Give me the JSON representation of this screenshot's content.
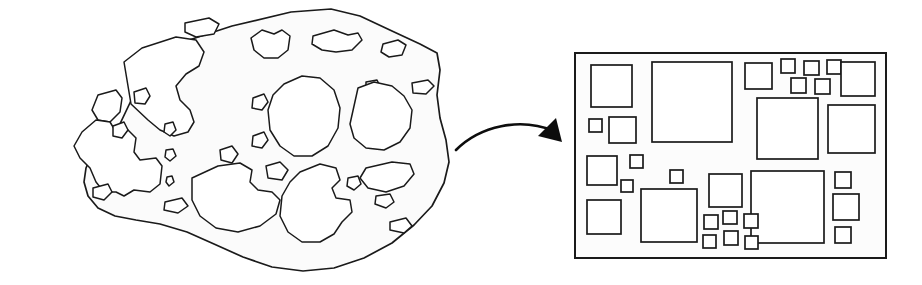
{
  "figure": {
    "background_color": "#ffffff",
    "ink_color": "#1a1a1a",
    "width": 922,
    "height": 285
  },
  "left_panel": {
    "label": "irregular-porous-shape",
    "description": "Hand-drawn irregular blob outline containing many rounded void regions of varying size",
    "matrix_fill_color": "#fbfbfb",
    "void_fill_color": "#ffffff",
    "void_count": 28,
    "outline_path": "M 118 128 L 148 65 L 183 42 L 232 26 L 291 12 L 331 9 L 360 16 L 392 31 L 420 44 L 437 53 L 440 70 L 437 95 L 440 118 L 446 140 L 449 162 L 444 183 L 432 206 L 414 225 L 392 243 L 364 258 L 334 268 L 303 271 L 272 267 L 243 257 L 214 244 L 187 232 L 160 224 L 136 220 L 115 216 L 98 208 L 88 196 L 84 182 L 86 168 L 93 152 Z",
    "voids": [
      {
        "name": "void-upper-left-large",
        "path": "M 131 104 L 124 62 L 142 48 L 176 37 L 196 40 L 204 52 L 199 66 L 186 74 L 176 86 L 180 100 L 190 110 L 194 122 L 188 132 L 174 136 L 160 130 L 148 120 Z"
      },
      {
        "name": "void-top-notch",
        "path": "M 185 23 L 209 18 L 219 24 L 214 34 L 196 37 L 185 32 Z"
      },
      {
        "name": "void-top-mid-lobe",
        "path": "M 251 38 L 262 30 L 274 34 L 282 30 L 290 36 L 288 50 L 278 58 L 264 58 L 254 50 Z"
      },
      {
        "name": "void-top-right-wave",
        "path": "M 313 36 L 334 30 L 348 35 L 358 33 L 362 40 L 352 50 L 336 52 L 322 50 L 312 44 Z"
      },
      {
        "name": "void-top-far-right",
        "path": "M 383 44 L 398 40 L 406 45 L 402 55 L 389 57 L 381 52 Z"
      },
      {
        "name": "void-left-edge-notch",
        "path": "M 98 95 L 116 90 L 122 98 L 120 112 L 110 122 L 98 120 L 92 110 Z"
      },
      {
        "name": "void-small-left-upper",
        "path": "M 134 92 L 146 88 L 150 96 L 145 104 L 135 103 Z"
      },
      {
        "name": "void-mid-upper-dot",
        "path": "M 253 98 L 264 94 L 268 102 L 262 110 L 252 108 Z"
      },
      {
        "name": "void-right-upper-dot",
        "path": "M 366 82 L 377 80 L 381 88 L 374 94 L 366 90 Z"
      },
      {
        "name": "void-right-sliver",
        "path": "M 412 83 L 428 80 L 434 86 L 426 94 L 413 93 Z"
      },
      {
        "name": "void-center-large-round",
        "path": "M 284 84 L 302 76 L 320 78 L 334 90 L 340 108 L 338 128 L 328 146 L 312 156 L 294 156 L 280 146 L 270 130 L 268 110 L 273 95 Z"
      },
      {
        "name": "void-right-large-lobe",
        "path": "M 358 88 L 374 82 L 392 86 L 404 96 L 412 110 L 410 128 L 400 142 L 384 150 L 366 148 L 354 138 L 350 124 L 354 106 Z"
      },
      {
        "name": "void-left-star",
        "path": "M 82 132 L 96 120 L 110 122 L 116 132 L 128 130 L 136 138 L 134 152 L 140 160 L 156 158 L 162 166 L 160 184 L 150 192 L 134 190 L 124 196 L 116 192 L 104 192 L 96 182 L 90 168 L 80 158 L 74 146 Z"
      },
      {
        "name": "void-small-mid-1",
        "path": "M 113 126 L 124 122 L 128 130 L 122 138 L 113 136 Z"
      },
      {
        "name": "void-tiny-1",
        "path": "M 165 124 L 173 122 L 176 130 L 170 136 L 164 132 Z"
      },
      {
        "name": "void-tiny-2",
        "path": "M 166 150 L 173 149 L 176 156 L 170 161 L 165 157 Z"
      },
      {
        "name": "void-tiny-3",
        "path": "M 167 177 L 172 176 L 174 182 L 169 186 L 166 182 Z"
      },
      {
        "name": "void-mid-sliver",
        "path": "M 220 150 L 232 146 L 238 154 L 232 163 L 221 160 Z"
      },
      {
        "name": "void-lower-left-tri",
        "path": "M 93 188 L 108 184 L 112 192 L 104 200 L 93 197 Z"
      },
      {
        "name": "void-lower-left-tri2",
        "path": "M 165 202 L 182 198 L 188 206 L 178 213 L 164 210 Z"
      },
      {
        "name": "void-bottom-mid-large",
        "path": "M 192 178 L 218 166 L 240 163 L 252 170 L 250 182 L 258 190 L 272 192 L 280 200 L 276 214 L 260 226 L 238 232 L 216 228 L 200 216 L 192 200 Z"
      },
      {
        "name": "void-mid-gap",
        "path": "M 266 166 L 280 162 L 288 170 L 282 180 L 268 178 Z"
      },
      {
        "name": "void-center-small",
        "path": "M 253 136 L 264 132 L 268 140 L 262 148 L 252 146 Z"
      },
      {
        "name": "void-bottom-right-large",
        "path": "M 300 172 L 320 164 L 336 168 L 340 180 L 332 188 L 336 198 L 350 200 L 352 212 L 342 222 L 334 234 L 320 242 L 302 242 L 288 232 L 280 216 L 282 196 L 290 182 Z"
      },
      {
        "name": "void-bottom-right-dot",
        "path": "M 348 178 L 358 176 L 361 184 L 354 190 L 347 186 Z"
      },
      {
        "name": "void-right-lower-flat",
        "path": "M 366 168 L 392 162 L 410 164 L 414 174 L 404 186 L 386 192 L 368 188 L 360 178 Z"
      },
      {
        "name": "void-right-lower-dot",
        "path": "M 376 196 L 390 194 L 394 202 L 386 208 L 375 204 Z"
      },
      {
        "name": "void-bottom-far-right",
        "path": "M 390 222 L 406 218 L 412 226 L 404 233 L 390 230 Z"
      }
    ]
  },
  "arrow": {
    "name": "transformation-arrow",
    "direction": "left-to-right",
    "style": "curved",
    "color": "#0d0d0d",
    "curve_path": "M 456 150 C 480 126, 520 117, 554 131",
    "head_points": "556 118, 562 142, 538 136"
  },
  "right_panel": {
    "label": "idealized-square-packing",
    "description": "Rectangular frame containing axis-aligned squares of varying size representing idealized voids",
    "frame": {
      "x": 575,
      "y": 53,
      "width": 311,
      "height": 205
    },
    "frame_fill_color": "#fcfcfc",
    "cell_fill_color": "#ffffff",
    "cell_count": 31,
    "cells": [
      {
        "name": "square-1",
        "x": 591,
        "y": 65,
        "w": 41,
        "h": 42
      },
      {
        "name": "square-2",
        "x": 652,
        "y": 62,
        "w": 80,
        "h": 80
      },
      {
        "name": "square-3",
        "x": 745,
        "y": 63,
        "w": 27,
        "h": 26
      },
      {
        "name": "square-4",
        "x": 781,
        "y": 59,
        "w": 14,
        "h": 14
      },
      {
        "name": "square-5",
        "x": 804,
        "y": 61,
        "w": 15,
        "h": 14
      },
      {
        "name": "square-6",
        "x": 827,
        "y": 60,
        "w": 14,
        "h": 14
      },
      {
        "name": "square-7",
        "x": 791,
        "y": 78,
        "w": 15,
        "h": 15
      },
      {
        "name": "square-8",
        "x": 815,
        "y": 79,
        "w": 15,
        "h": 15
      },
      {
        "name": "square-9",
        "x": 841,
        "y": 62,
        "w": 34,
        "h": 34
      },
      {
        "name": "square-10",
        "x": 589,
        "y": 119,
        "w": 13,
        "h": 13
      },
      {
        "name": "square-11",
        "x": 609,
        "y": 117,
        "w": 27,
        "h": 26
      },
      {
        "name": "square-12",
        "x": 757,
        "y": 98,
        "w": 61,
        "h": 61
      },
      {
        "name": "square-13",
        "x": 828,
        "y": 105,
        "w": 47,
        "h": 48
      },
      {
        "name": "square-14",
        "x": 587,
        "y": 156,
        "w": 30,
        "h": 29
      },
      {
        "name": "square-15",
        "x": 630,
        "y": 155,
        "w": 13,
        "h": 13
      },
      {
        "name": "square-16",
        "x": 621,
        "y": 180,
        "w": 12,
        "h": 12
      },
      {
        "name": "square-17",
        "x": 587,
        "y": 200,
        "w": 34,
        "h": 34
      },
      {
        "name": "square-18",
        "x": 641,
        "y": 189,
        "w": 56,
        "h": 53
      },
      {
        "name": "square-19",
        "x": 670,
        "y": 170,
        "w": 13,
        "h": 13
      },
      {
        "name": "square-20",
        "x": 709,
        "y": 174,
        "w": 33,
        "h": 33
      },
      {
        "name": "square-21",
        "x": 751,
        "y": 171,
        "w": 73,
        "h": 72
      },
      {
        "name": "square-22",
        "x": 704,
        "y": 215,
        "w": 14,
        "h": 14
      },
      {
        "name": "square-23",
        "x": 723,
        "y": 211,
        "w": 14,
        "h": 13
      },
      {
        "name": "square-24",
        "x": 744,
        "y": 214,
        "w": 14,
        "h": 14
      },
      {
        "name": "square-25",
        "x": 724,
        "y": 231,
        "w": 14,
        "h": 14
      },
      {
        "name": "square-26",
        "x": 703,
        "y": 235,
        "w": 13,
        "h": 13
      },
      {
        "name": "square-27",
        "x": 745,
        "y": 236,
        "w": 13,
        "h": 13
      },
      {
        "name": "square-28",
        "x": 835,
        "y": 172,
        "w": 16,
        "h": 16
      },
      {
        "name": "square-29",
        "x": 833,
        "y": 194,
        "w": 26,
        "h": 26
      },
      {
        "name": "square-30",
        "x": 835,
        "y": 227,
        "w": 16,
        "h": 16
      },
      {
        "name": "square-31",
        "x": 757,
        "y": 98,
        "w": 0,
        "h": 0
      }
    ]
  }
}
